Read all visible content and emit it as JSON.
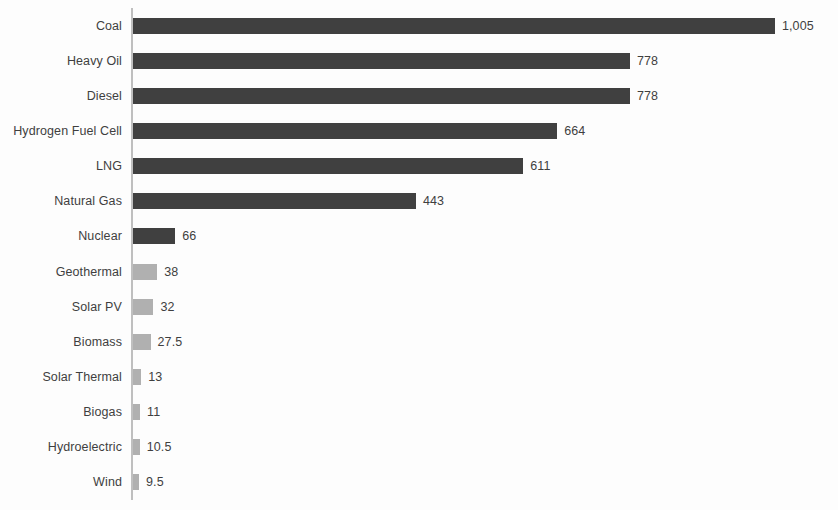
{
  "chart_data": {
    "type": "bar",
    "orientation": "horizontal",
    "title": "",
    "subtitle": "",
    "xlabel": "",
    "ylabel": "",
    "grid": false,
    "legend": null,
    "xlim": [
      0,
      1005
    ],
    "categories": [
      "Coal",
      "Heavy Oil",
      "Diesel",
      "Hydrogen Fuel Cell",
      "LNG",
      "Natural Gas",
      "Nuclear",
      "Geothermal",
      "Solar PV",
      "Biomass",
      "Solar Thermal",
      "Biogas",
      "Hydroelectric",
      "Wind"
    ],
    "values": [
      1005,
      778,
      778,
      664,
      611,
      443,
      66,
      38,
      32,
      27.5,
      13,
      11,
      10.5,
      9.5
    ],
    "value_labels": [
      "1,005",
      "778",
      "778",
      "664",
      "611",
      "443",
      "66",
      "38",
      "32",
      "27.5",
      "13",
      "11",
      "10.5",
      "9.5"
    ],
    "bar_colors": [
      "#404040",
      "#404040",
      "#404040",
      "#404040",
      "#404040",
      "#404040",
      "#404040",
      "#b0b0b0",
      "#b0b0b0",
      "#b0b0b0",
      "#b0b0b0",
      "#b0b0b0",
      "#b0b0b0",
      "#b0b0b0"
    ],
    "colors": {
      "fossil_bar": "#404040",
      "renewable_bar": "#b0b0b0",
      "axis": "#bfbfbf",
      "text": "#3f3f3f",
      "background": "#fdfdfd"
    }
  }
}
